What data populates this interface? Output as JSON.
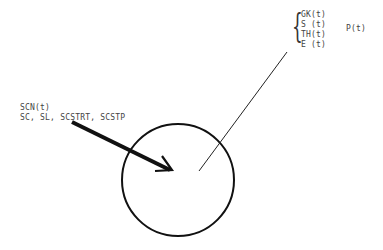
{
  "diagram": {
    "outputs": [
      "GK(t)",
      "S (t)",
      "TH(t)",
      "E (t)"
    ],
    "output_group_label": "P(t)",
    "input_label_1": "SCN(t)",
    "input_label_2": "SC, SL, SCSTRT, SCSTP",
    "colors": {
      "stroke": "#111111",
      "text": "#444444"
    }
  }
}
